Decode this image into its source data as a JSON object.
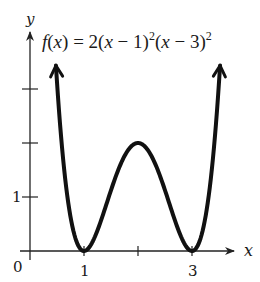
{
  "chart_data": {
    "type": "line",
    "title_parts": {
      "lhs": "f",
      "arg": "(x)",
      "eq": " = 2(",
      "x1": "x",
      "m1": " − 1)",
      "exp1": "2",
      "open2": "(",
      "x2": "x",
      "m2": " − 3)",
      "exp2": "2"
    },
    "xlabel": "x",
    "ylabel": "y",
    "origin_label": "0",
    "x_tick_labels": [
      {
        "value": 1,
        "label": "1"
      },
      {
        "value": 2,
        "label": ""
      },
      {
        "value": 3,
        "label": "3"
      }
    ],
    "y_tick_labels": [
      {
        "value": 1,
        "label": "1"
      },
      {
        "value": 2,
        "label": ""
      },
      {
        "value": 3,
        "label": ""
      }
    ],
    "xlim": [
      0,
      4
    ],
    "ylim": [
      0,
      3.8
    ],
    "grid": false,
    "legend": null,
    "function": "2*(x-1)^2*(x-3)^2",
    "domain_shown": [
      0.48,
      3.52
    ],
    "arrows_at_ends": true,
    "key_points": [
      {
        "x": 1,
        "y": 0,
        "type": "local minimum"
      },
      {
        "x": 2,
        "y": 2,
        "type": "local maximum"
      },
      {
        "x": 3,
        "y": 0,
        "type": "local minimum"
      }
    ],
    "x": [
      0.48,
      0.6,
      0.8,
      1.0,
      1.2,
      1.4,
      1.6,
      1.8,
      2.0,
      2.2,
      2.4,
      2.6,
      2.8,
      3.0,
      3.2,
      3.4,
      3.52
    ],
    "series": [
      {
        "name": "f(x)",
        "values": [
          3.44,
          2.46,
          1.06,
          0.0,
          0.26,
          0.83,
          1.39,
          1.8,
          2.0,
          1.8,
          1.39,
          0.83,
          0.26,
          0.0,
          1.06,
          2.46,
          3.44
        ]
      }
    ],
    "colors": {
      "curve": "#111111",
      "axes": "#222222",
      "text": "#1a1a1a"
    }
  }
}
